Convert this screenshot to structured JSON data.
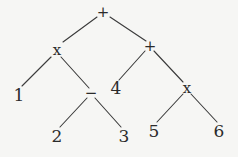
{
  "diagram": {
    "type": "expression-tree",
    "expression": "(1 x (2 - 3)) + (4 + (5 x 6))",
    "nodes": [
      {
        "id": "root",
        "label": "+",
        "kind": "operator",
        "x": 103,
        "y": 12
      },
      {
        "id": "mul_l",
        "label": "x",
        "kind": "operator",
        "x": 57,
        "y": 50
      },
      {
        "id": "add_r",
        "label": "+",
        "kind": "operator",
        "x": 150,
        "y": 46
      },
      {
        "id": "n1",
        "label": "1",
        "kind": "operand",
        "x": 19,
        "y": 95
      },
      {
        "id": "sub",
        "label": "−",
        "kind": "operator",
        "x": 91,
        "y": 93
      },
      {
        "id": "n4",
        "label": "4",
        "kind": "operand",
        "x": 116,
        "y": 88
      },
      {
        "id": "mul_r",
        "label": "x",
        "kind": "operator",
        "x": 187,
        "y": 88
      },
      {
        "id": "n2",
        "label": "2",
        "kind": "operand",
        "x": 57,
        "y": 136
      },
      {
        "id": "n3",
        "label": "3",
        "kind": "operand",
        "x": 124,
        "y": 136
      },
      {
        "id": "n5",
        "label": "5",
        "kind": "operand",
        "x": 154,
        "y": 131
      },
      {
        "id": "n6",
        "label": "6",
        "kind": "operand",
        "x": 219,
        "y": 131
      }
    ],
    "edges": [
      {
        "from": "root",
        "to": "mul_l",
        "x1": 97,
        "y1": 17,
        "x2": 63,
        "y2": 42
      },
      {
        "from": "root",
        "to": "add_r",
        "x1": 110,
        "y1": 17,
        "x2": 146,
        "y2": 41
      },
      {
        "from": "mul_l",
        "to": "n1",
        "x1": 51,
        "y1": 57,
        "x2": 22,
        "y2": 86
      },
      {
        "from": "mul_l",
        "to": "sub",
        "x1": 61,
        "y1": 57,
        "x2": 89,
        "y2": 88
      },
      {
        "from": "add_r",
        "to": "n4",
        "x1": 145,
        "y1": 51,
        "x2": 119,
        "y2": 80
      },
      {
        "from": "add_r",
        "to": "mul_r",
        "x1": 154,
        "y1": 51,
        "x2": 183,
        "y2": 82
      },
      {
        "from": "sub",
        "to": "n2",
        "x1": 87,
        "y1": 98,
        "x2": 60,
        "y2": 127
      },
      {
        "from": "sub",
        "to": "n3",
        "x1": 95,
        "y1": 98,
        "x2": 121,
        "y2": 127
      },
      {
        "from": "mul_r",
        "to": "n5",
        "x1": 183,
        "y1": 94,
        "x2": 157,
        "y2": 122
      },
      {
        "from": "mul_r",
        "to": "n6",
        "x1": 191,
        "y1": 94,
        "x2": 217,
        "y2": 122
      }
    ]
  }
}
